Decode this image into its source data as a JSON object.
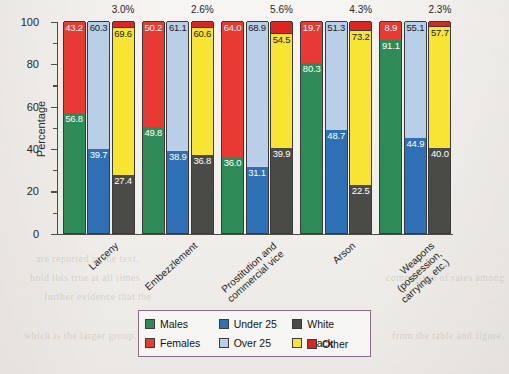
{
  "chart_data": {
    "type": "bar",
    "subtype": "stacked-100-percent-grouped",
    "title": "",
    "xlabel": "",
    "ylabel": "Percentage",
    "ylim": [
      0,
      100
    ],
    "yticks_major": [
      0,
      20,
      40,
      60,
      80,
      100
    ],
    "yticks_minor": [
      10,
      30,
      50,
      70,
      90
    ],
    "grid": false,
    "legend_position": "bottom-center",
    "categories": [
      "Larceny",
      "Embezzlement",
      "Prostitution and commercial vice",
      "Arson",
      "Weapons (possession, carrying, etc.)"
    ],
    "category_lines": [
      [
        "Larceny"
      ],
      [
        "Embezzlement"
      ],
      [
        "Prostitution and",
        "commercial vice"
      ],
      [
        "Arson"
      ],
      [
        "Weapons",
        "(possession,",
        "carrying, etc.)"
      ]
    ],
    "stacks": [
      {
        "name": "Sex",
        "series": [
          {
            "name": "Males",
            "color": "#2e8b57",
            "values": [
              56.8,
              49.8,
              36.0,
              80.3,
              91.1
            ]
          },
          {
            "name": "Females",
            "color": "#e83a33",
            "values": [
              43.2,
              50.2,
              64.0,
              19.7,
              8.9
            ]
          }
        ]
      },
      {
        "name": "Age",
        "series": [
          {
            "name": "Under 25",
            "color": "#2f6fb5",
            "values": [
              39.7,
              38.9,
              31.1,
              48.7,
              44.9
            ]
          },
          {
            "name": "Over 25",
            "color": "#b9cfe8",
            "values": [
              60.3,
              61.1,
              68.9,
              51.3,
              55.1
            ]
          }
        ]
      },
      {
        "name": "Race",
        "series": [
          {
            "name": "White",
            "color": "#4a4a46",
            "values": [
              27.4,
              36.8,
              39.9,
              22.5,
              40.0
            ]
          },
          {
            "name": "Black",
            "color": "#f7e433",
            "values": [
              69.6,
              60.6,
              54.5,
              73.2,
              57.7
            ]
          },
          {
            "name": "Other",
            "color": "#d92620",
            "values": [
              3.0,
              2.6,
              5.6,
              4.3,
              2.3
            ]
          }
        ]
      }
    ],
    "other_annotations": [
      "3.0%",
      "2.6%",
      "5.6%",
      "4.3%",
      "2.3%"
    ],
    "legend_entries": [
      {
        "label": "Males",
        "color": "#2e8b57"
      },
      {
        "label": "Under 25",
        "color": "#2f6fb5"
      },
      {
        "label": "White",
        "color": "#4a4a46"
      },
      {
        "label": "Females",
        "color": "#e83a33"
      },
      {
        "label": "Over 25",
        "color": "#b9cfe8"
      },
      {
        "label": "Black",
        "color": "#f7e433"
      },
      {
        "label": "Other",
        "color": "#d92620"
      }
    ]
  },
  "background_page_text": [
    "are reported in the text.",
    "hold this true at all times",
    "further evidence that the",
    "which is the larger group.",
    "comparison of rates among",
    "from the table and figure."
  ]
}
